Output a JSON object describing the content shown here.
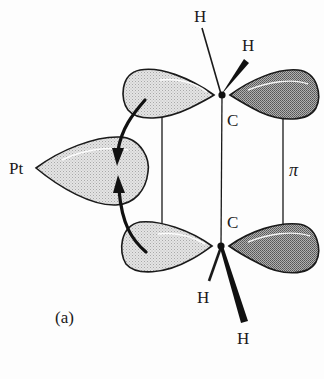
{
  "figure": {
    "panel_label": "(a)",
    "atoms": {
      "metal": "Pt",
      "carbon_top": "C",
      "carbon_bottom": "C",
      "h_top_left": "H",
      "h_top_right": "H",
      "h_bottom_left": "H",
      "h_bottom_right": "H"
    },
    "bond_label": "π",
    "colors": {
      "outline": "#1a1a1a",
      "light_lobe": "#d9d9d9",
      "dark_lobe": "#9a9a9a",
      "highlight": "#ffffff",
      "background": "#fdfdfd"
    }
  }
}
